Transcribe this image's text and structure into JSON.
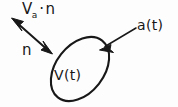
{
  "diagram": {
    "background_color": "#fdfdfd",
    "ink_color": "#181818",
    "labels": {
      "velocity_normal": {
        "base": "V",
        "subscript": "a",
        "operator": "·",
        "normal": "n",
        "full_text": "Vₐ·n"
      },
      "normal_vector": "n",
      "boundary": "a(t)",
      "volume": "V(t)"
    },
    "shapes": {
      "ellipse": {
        "name": "control-volume-ellipse",
        "center_x": 80,
        "center_y": 69,
        "radius_major": 36,
        "radius_minor": 24,
        "rotation_deg": -52
      },
      "arrow_upper_left": {
        "name": "velocity-normal-arrow",
        "from_x": 50,
        "from_y": 52,
        "to_x": 13,
        "to_y": 19,
        "double_headed": true
      },
      "arrow_boundary": {
        "name": "boundary-pointer-arrow",
        "from_x": 136,
        "from_y": 28,
        "to_x": 101,
        "to_y": 49,
        "double_headed": false
      }
    }
  }
}
